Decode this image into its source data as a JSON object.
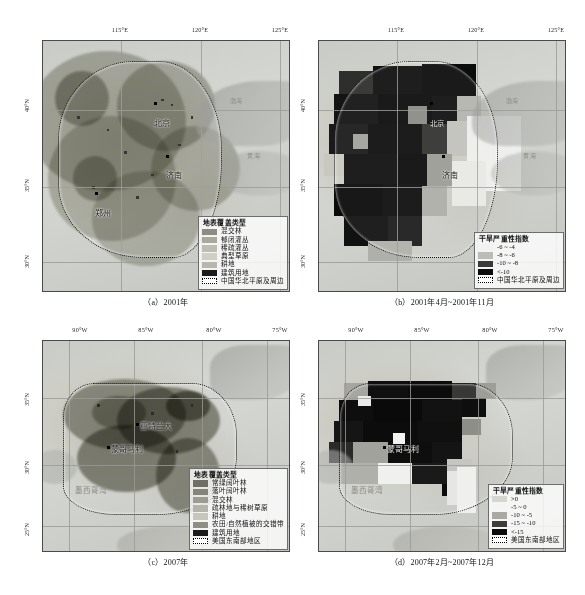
{
  "figure": {
    "panels": [
      {
        "id": "a",
        "caption": "（a）2001年",
        "axis_x": [
          "115°E",
          "120°E",
          "125°E"
        ],
        "axis_y": [
          "40°N",
          "35°N",
          "30°N"
        ],
        "cities": [
          "北京",
          "济南",
          "郑州"
        ],
        "sea_labels": [
          "渤海",
          "黄海"
        ],
        "legend": {
          "title": "地表覆盖类型",
          "items": [
            {
              "label": "混交林",
              "color": "#8c8c84"
            },
            {
              "label": "郁闭灌丛",
              "color": "#a8a89e"
            },
            {
              "label": "稀疏灌丛",
              "color": "#bdbdb3"
            },
            {
              "label": "典型草原",
              "color": "#cfcfc6"
            },
            {
              "label": "耕地",
              "color": "#b7b7ad"
            },
            {
              "label": "建筑用地",
              "color": "#1c1c1c"
            },
            {
              "label": "中国华北平原及周边",
              "color": "outline"
            }
          ]
        }
      },
      {
        "id": "b",
        "caption": "（b）2001年4月~2001年11月",
        "axis_x": [
          "115°E",
          "120°E",
          "125°E"
        ],
        "axis_y": [
          "40°N",
          "35°N",
          "30°N"
        ],
        "cities": [
          "北京",
          "济南"
        ],
        "sea_labels": [
          "渤海",
          "黄海"
        ],
        "legend": {
          "title": "干旱严重性指数",
          "items": [
            {
              "label": "-6 ~ -4",
              "color": "#f2f2f0"
            },
            {
              "label": "-8 ~ -6",
              "color": "#bcbcb6"
            },
            {
              "label": "-10 ~ -8",
              "color": "#3a3a38"
            },
            {
              "label": "<-10",
              "color": "#0c0c0c"
            },
            {
              "label": "中国华北平原及周边",
              "color": "outline"
            }
          ]
        }
      },
      {
        "id": "c",
        "caption": "（c）2007年",
        "axis_x": [
          "90°W",
          "85°W",
          "80°W",
          "75°W"
        ],
        "axis_y": [
          "35°N",
          "30°N",
          "25°N"
        ],
        "cities": [
          "亚特兰大",
          "蒙哥马利"
        ],
        "sea_labels": [
          "墨西哥湾"
        ],
        "legend": {
          "title": "地表覆盖类型",
          "items": [
            {
              "label": "常绿阔叶林",
              "color": "#6e6e66"
            },
            {
              "label": "落叶阔叶林",
              "color": "#84847b"
            },
            {
              "label": "混交林",
              "color": "#9c9c93"
            },
            {
              "label": "疏林地与稀树草原",
              "color": "#b4b4aa"
            },
            {
              "label": "耕地",
              "color": "#c6c6bc"
            },
            {
              "label": "农田/自然植被的交错带",
              "color": "#8e8e85"
            },
            {
              "label": "建筑用地",
              "color": "#191919"
            },
            {
              "label": "美国东南部地区",
              "color": "outline"
            }
          ]
        }
      },
      {
        "id": "d",
        "caption": "（d）2007年2月~2007年12月",
        "axis_x": [
          "90°W",
          "85°W",
          "80°W",
          "75°W"
        ],
        "axis_y": [
          "35°N",
          "30°N",
          "25°N"
        ],
        "cities": [
          "蒙哥马利"
        ],
        "sea_labels": [
          "墨西哥湾"
        ],
        "legend": {
          "title": "干旱严重性指数",
          "items": [
            {
              "label": ">0",
              "color": "#d6d6d1"
            },
            {
              "label": "-5 ~ 0",
              "color": "#f4f4f2"
            },
            {
              "label": "-10 ~ -5",
              "color": "#a9a9a2"
            },
            {
              "label": "-15 ~ -10",
              "color": "#3c3c3a"
            },
            {
              "label": "<-15",
              "color": "#0b0b0b"
            },
            {
              "label": "美国东南部地区",
              "color": "outline"
            }
          ]
        }
      }
    ]
  }
}
